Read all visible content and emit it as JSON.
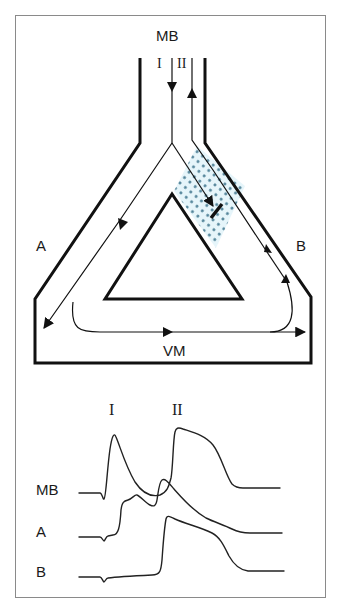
{
  "diagram": {
    "type": "reentry-circuit-schematic",
    "labels": {
      "top": "MB",
      "left": "A",
      "right": "B",
      "bottom": "VM",
      "pathway_1": "I",
      "pathway_2": "II"
    },
    "regions": {
      "block_zone": {
        "description": "dotted zone on right limb with unidirectional block",
        "fill_color": "#e6f5fa",
        "dot_color": "#4d8096"
      }
    },
    "colors": {
      "line": "#111111",
      "frame": "#8a8a8a",
      "background": "#ffffff"
    }
  },
  "traces": {
    "header_labels": {
      "first": "I",
      "second": "II"
    },
    "rows": [
      {
        "label": "MB"
      },
      {
        "label": "A"
      },
      {
        "label": "B"
      }
    ]
  }
}
